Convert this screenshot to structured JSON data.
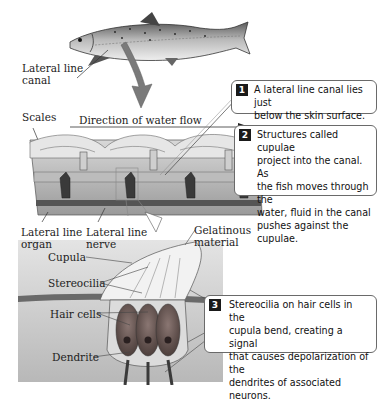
{
  "diagram": {
    "labels": {
      "lateral_line_canal": [
        "Lateral line",
        "canal"
      ],
      "scales": "Scales",
      "direction": "Direction of water flow",
      "lateral_line_organ": [
        "Lateral line",
        "organ"
      ],
      "lateral_line_nerve": [
        "Lateral line",
        "nerve"
      ],
      "gelatinous_material": [
        "Gelatinous",
        "material"
      ],
      "cupula": "Cupula",
      "stereocilia": "Stereocilia",
      "hair_cells": "Hair cells",
      "dendrite": "Dendrite"
    },
    "callouts": [
      {
        "number": "1",
        "lines": [
          "A lateral line canal lies just",
          "below the skin surface."
        ]
      },
      {
        "number": "2",
        "lines": [
          "Structures called cupulae",
          "project into the canal. As",
          "the fish moves through the",
          "water, fluid in the canal",
          "pushes against the cupulae."
        ]
      },
      {
        "number": "3",
        "lines": [
          "Stereocilia on hair cells in the",
          "cupula bend, creating a signal",
          "that causes depolarization of the",
          "dendrites of associated neurons."
        ]
      }
    ],
    "colors": {
      "arrow": "#7a7a7a",
      "hair_cell": "#6b5a55",
      "tissue": "#c9c9c9",
      "callout_border": "#6a6a6a",
      "number_badge": "#1a1a1a"
    }
  }
}
